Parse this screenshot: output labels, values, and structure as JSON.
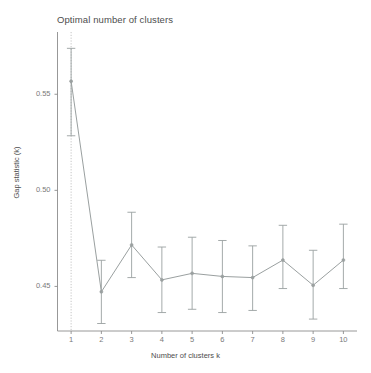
{
  "chart_data": {
    "type": "line",
    "title": "Optimal number of clusters",
    "xlabel": "Number of clusters k",
    "ylabel": "Gap statistic (k)",
    "categories": [
      "1",
      "2",
      "3",
      "4",
      "5",
      "6",
      "7",
      "8",
      "9",
      "10"
    ],
    "x": [
      1,
      2,
      3,
      4,
      5,
      6,
      7,
      8,
      9,
      10
    ],
    "values": [
      0.5568,
      0.4472,
      0.4716,
      0.4534,
      0.4568,
      0.4552,
      0.4546,
      0.4637,
      0.4506,
      0.4637
    ],
    "errors_lower": [
      0.5284,
      0.4307,
      0.4546,
      0.4364,
      0.4381,
      0.4364,
      0.4375,
      0.4489,
      0.433,
      0.4489
    ],
    "errors_upper": [
      0.5739,
      0.4636,
      0.4886,
      0.4705,
      0.4756,
      0.4739,
      0.4711,
      0.4818,
      0.4688,
      0.4824
    ],
    "ytick_labels": [
      "0.55",
      "0.50",
      "0.45"
    ],
    "ytick_values": [
      0.55,
      0.5,
      0.45
    ],
    "xtick_labels": [
      "1",
      "2",
      "3",
      "4",
      "5",
      "6",
      "7",
      "8",
      "9",
      "10"
    ],
    "ylim": [
      0.4268,
      0.5824
    ],
    "xlim": [
      0.55,
      10.45
    ],
    "grid": false,
    "legend": false,
    "annotations": [
      {
        "name": "optimal-k-line",
        "type": "vline",
        "x": 1,
        "style": "dotted",
        "label": ""
      }
    ],
    "series_color": "#9aa0a0",
    "annotation_color": "#bdbdbd",
    "axis_color": "#8c8c8c",
    "text_color": "#4d4d4d",
    "tick_text_color": "#7a7a7a"
  },
  "figure": {
    "background": "#ffffff"
  }
}
